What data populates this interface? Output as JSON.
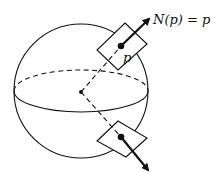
{
  "diagram": {
    "labels": {
      "normal_equation": "N(p) = p",
      "point": "p"
    },
    "colors": {
      "stroke": "#111111",
      "background": "#ffffff"
    },
    "elements": [
      {
        "id": "sphere",
        "type": "circle"
      },
      {
        "id": "equator",
        "type": "ellipse",
        "back_half": "dashed",
        "front_half": "solid"
      },
      {
        "id": "center",
        "type": "point"
      },
      {
        "id": "upper-tangent-plane",
        "type": "parallelogram"
      },
      {
        "id": "lower-tangent-plane",
        "type": "parallelogram"
      },
      {
        "id": "upper-normal",
        "type": "arrow"
      },
      {
        "id": "lower-normal",
        "type": "arrow"
      },
      {
        "id": "radius-upper",
        "type": "dashed-line"
      },
      {
        "id": "radius-lower",
        "type": "dashed-line"
      }
    ]
  }
}
